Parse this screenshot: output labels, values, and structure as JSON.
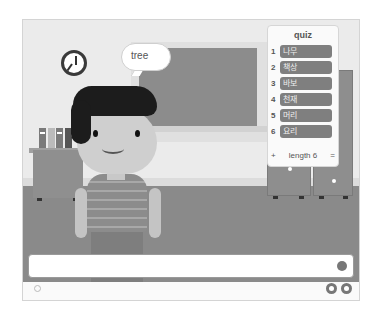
{
  "stage": {
    "speech_bubble": "tree"
  },
  "list_monitor": {
    "title": "quiz",
    "items": [
      {
        "index": "1",
        "value": "나무"
      },
      {
        "index": "2",
        "value": "책상"
      },
      {
        "index": "3",
        "value": "바보"
      },
      {
        "index": "4",
        "value": "천재"
      },
      {
        "index": "5",
        "value": "머리"
      },
      {
        "index": "6",
        "value": "요리"
      }
    ],
    "add_label": "+",
    "length_label": "length 6",
    "resize_label": "="
  },
  "ask_box": {
    "value": "",
    "placeholder": ""
  },
  "icons": {
    "submit": "check-circle-icon",
    "zoom_out": "zoom-out-icon",
    "zoom_in": "zoom-in-icon",
    "settings": "gear-icon"
  }
}
